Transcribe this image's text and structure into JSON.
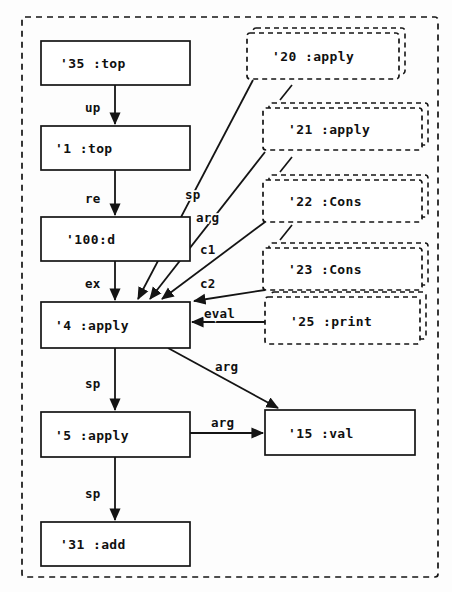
{
  "diagram": {
    "frame": {
      "name": "outer-dashed-frame"
    },
    "solid_nodes": [
      {
        "id": "n35",
        "label": "'35 :top",
        "x": 41,
        "y": 41,
        "w": 149,
        "h": 44
      },
      {
        "id": "n1",
        "label": "'1 :top",
        "x": 41,
        "y": 126,
        "w": 149,
        "h": 44
      },
      {
        "id": "n100",
        "label": "'100:d",
        "x": 41,
        "y": 217,
        "w": 149,
        "h": 44
      },
      {
        "id": "n4",
        "label": "'4 :apply",
        "x": 41,
        "y": 302,
        "w": 149,
        "h": 46
      },
      {
        "id": "n5",
        "label": "'5 :apply",
        "x": 41,
        "y": 412,
        "w": 149,
        "h": 45
      },
      {
        "id": "n31",
        "label": "'31 :add",
        "x": 41,
        "y": 522,
        "w": 149,
        "h": 44
      },
      {
        "id": "n15",
        "label": "'15 :val",
        "x": 265,
        "y": 410,
        "w": 150,
        "h": 45
      }
    ],
    "dashed_nodes": [
      {
        "id": "n20",
        "label": "'20 :apply",
        "x": 247,
        "y": 33,
        "w": 152,
        "h": 46
      },
      {
        "id": "n21",
        "label": "'21 :apply",
        "x": 263,
        "y": 108,
        "w": 159,
        "h": 42
      },
      {
        "id": "n22",
        "label": "'22 :Cons",
        "x": 263,
        "y": 180,
        "w": 159,
        "h": 42
      },
      {
        "id": "n23",
        "label": "'23 :Cons",
        "x": 263,
        "y": 248,
        "w": 159,
        "h": 42
      },
      {
        "id": "n25",
        "label": "'25 :print",
        "x": 265,
        "y": 297,
        "w": 155,
        "h": 47
      }
    ],
    "edges": [
      {
        "id": "e1",
        "label": "up",
        "from": "n35",
        "to": "n1",
        "label_x": 99,
        "label_y": 112
      },
      {
        "id": "e2",
        "label": "re",
        "from": "n1",
        "to": "n100",
        "label_x": 99,
        "label_y": 203
      },
      {
        "id": "e3",
        "label": "ex",
        "from": "n100",
        "to": "n4",
        "label_x": 99,
        "label_y": 288
      },
      {
        "id": "e4",
        "label": "sp",
        "from": "n20",
        "to": "n4",
        "label_x": 194,
        "label_y": 198
      },
      {
        "id": "e5",
        "label": "arg",
        "from": "n21",
        "to": "n4",
        "label_x": 207,
        "label_y": 217
      },
      {
        "id": "e6",
        "label": "c1",
        "from": "n22",
        "to": "n4",
        "label_x": 209,
        "label_y": 252
      },
      {
        "id": "e7",
        "label": "c2",
        "from": "n23",
        "to": "n4",
        "label_x": 209,
        "label_y": 287
      },
      {
        "id": "e8",
        "label": "eval",
        "from": "n25",
        "to": "n4",
        "label_x": 221,
        "label_y": 317
      },
      {
        "id": "e9",
        "label": "arg",
        "from": "n4",
        "to": "n15",
        "label_x": 228,
        "label_y": 370
      },
      {
        "id": "e10",
        "label": "sp",
        "from": "n4",
        "to": "n5",
        "label_x": 99,
        "label_y": 388
      },
      {
        "id": "e11",
        "label": "arg",
        "from": "n5",
        "to": "n15",
        "label_x": 228,
        "label_y": 427
      },
      {
        "id": "e12",
        "label": "sp",
        "from": "n5",
        "to": "n31",
        "label_x": 99,
        "label_y": 498
      }
    ],
    "connectors": [
      {
        "id": "c20_21",
        "from": "n20",
        "to": "n21"
      },
      {
        "id": "c21_22",
        "from": "n21",
        "to": "n22"
      },
      {
        "id": "c22_23",
        "from": "n22",
        "to": "n23"
      }
    ],
    "colors": {
      "stroke": "#141414",
      "fill": "#ffffff",
      "background": "#fdfdfd"
    }
  }
}
